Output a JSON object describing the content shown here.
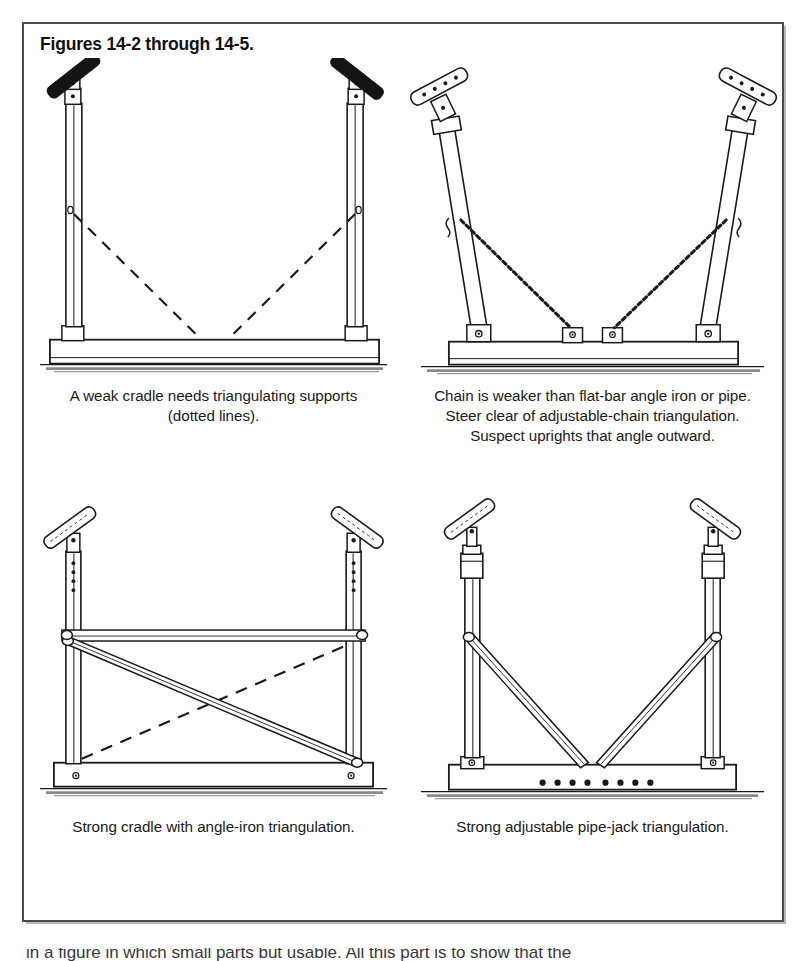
{
  "figure": {
    "title": "Figures 14-2 through 14-5.",
    "border_color": "#4a4a4a",
    "background_color": "#ffffff",
    "ink_color": "#1a1a1a"
  },
  "panels": [
    {
      "id": "figure-14-2",
      "name": "weak-cradle",
      "caption": "A weak cradle needs triangulating supports (dotted lines).",
      "art_name": "weak-cradle-diagram",
      "description": "Two vertical posts on a flat base with dashed triangulating lines"
    },
    {
      "id": "figure-14-3",
      "name": "chain-triangulation",
      "caption": "Chain is weaker than flat-bar angle iron or pipe. Steer clear of adjustable-chain triangulation. Suspect uprights that angle outward.",
      "art_name": "chain-triangulation-diagram",
      "description": "Outward angled uprights braced with chains to base brackets"
    },
    {
      "id": "figure-14-4",
      "name": "angle-iron-triangulation",
      "caption": "Strong cradle with angle-iron triangulation.",
      "art_name": "angle-iron-triangulation-diagram",
      "description": "Vertical posts with horizontal bar and crossing angle-iron plus dashed diagonal"
    },
    {
      "id": "figure-14-5",
      "name": "pipe-jack-triangulation",
      "caption": "Strong adjustable pipe-jack triangulation.",
      "art_name": "pipe-jack-triangulation-diagram",
      "description": "Adjustable pipe jacks with V braces meeting at base center"
    }
  ],
  "page_bleed": {
    "cut_off_text": "in a figure in which small parts but usable. All this part is to show that the"
  }
}
